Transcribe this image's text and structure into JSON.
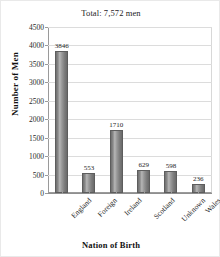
{
  "chart_data": {
    "type": "bar",
    "title": "Total: 7,572 men",
    "xlabel": "Nation of Birth",
    "ylabel": "Number of Men",
    "categories": [
      "England",
      "Foreign",
      "Ireland",
      "Scotland",
      "Unknown",
      "Wales"
    ],
    "values": [
      3846,
      553,
      1710,
      629,
      598,
      236
    ],
    "data_labels": [
      "3846",
      "553",
      "1710",
      "629",
      "598",
      "236"
    ],
    "ylim": [
      0,
      4500
    ],
    "ytick_step": 500,
    "yticks": [
      0,
      500,
      1000,
      1500,
      2000,
      2500,
      3000,
      3500,
      4000,
      4500
    ],
    "ytick_labels": [
      "0",
      "500",
      "1000",
      "1500",
      "2000",
      "2500",
      "3000",
      "3500",
      "4000",
      "4500"
    ],
    "grid": true,
    "legend": false,
    "bar_color": "#8a8a8a",
    "bar_border_color": "#5d5d5d",
    "gridline_color": "#dcdcdc",
    "axis_color": "#9a9a9a"
  }
}
